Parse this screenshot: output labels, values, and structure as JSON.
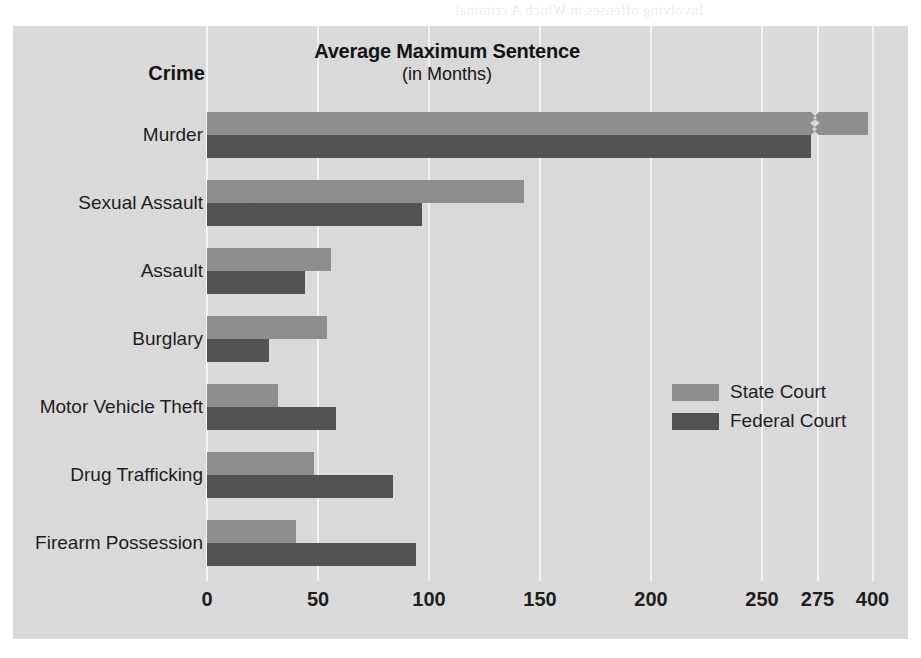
{
  "page": {
    "bleed_text_top": "Involving offenses in Which A criminal",
    "bleed_text_bottom": "ordinarily prison terms as well as should be punished. Thus the terms for"
  },
  "chart_data": {
    "type": "bar",
    "orientation": "horizontal",
    "title": "Average Maximum Sentence",
    "subtitle": "(in Months)",
    "category_axis_title": "Crime",
    "xlabel": "",
    "ylabel": "Crime",
    "grid": true,
    "legend_position": "inside-right",
    "axis_break": {
      "present": true,
      "between": [
        275,
        400
      ],
      "note": "broken axis between the 275 and 400 gridlines"
    },
    "xticks": [
      {
        "label": "0",
        "value": 0
      },
      {
        "label": "50",
        "value": 50
      },
      {
        "label": "100",
        "value": 100
      },
      {
        "label": "150",
        "value": 150
      },
      {
        "label": "200",
        "value": 200
      },
      {
        "label": "250",
        "value": 250
      },
      {
        "label": "275",
        "value": 275
      },
      {
        "label": "400",
        "value": 400
      }
    ],
    "xlim": [
      0,
      400
    ],
    "categories": [
      "Murder",
      "Sexual Assault",
      "Assault",
      "Burglary",
      "Motor Vehicle Theft",
      "Drug Trafficking",
      "Firearm Possession"
    ],
    "series": [
      {
        "name": "State Court",
        "color": "#8e8e8e",
        "values": [
          390,
          143,
          56,
          54,
          32,
          48,
          40
        ]
      },
      {
        "name": "Federal Court",
        "color": "#515151",
        "values": [
          272,
          97,
          44,
          28,
          58,
          84,
          94
        ]
      }
    ]
  },
  "colors": {
    "panel_background": "#dcdcdc",
    "gridline": "#f4f4f4",
    "text": "#1b1b1b",
    "state_court": "#8e8e8e",
    "federal_court": "#515151"
  }
}
